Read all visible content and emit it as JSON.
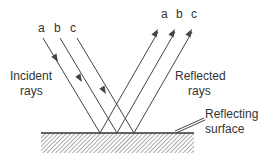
{
  "diagram": {
    "incident": {
      "ray_labels": [
        "a",
        "b",
        "c"
      ],
      "caption_line1": "Incident",
      "caption_line2": "rays"
    },
    "reflected": {
      "ray_labels": [
        "a",
        "b",
        "c"
      ],
      "caption_line1": "Reflected",
      "caption_line2": "rays"
    },
    "surface": {
      "caption_line1": "Reflecting",
      "caption_line2": "surface"
    },
    "colors": {
      "line": "#444444",
      "text": "#333333",
      "hatch": "#555555",
      "background": "#ffffff"
    }
  }
}
